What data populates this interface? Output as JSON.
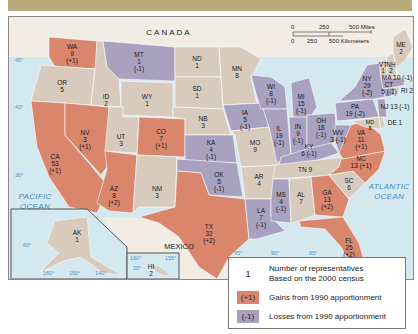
{
  "colors": {
    "gain": "#d9866d",
    "loss": "#a9a1c0",
    "nochange": "#d8cbbd",
    "water": "#d4e8f0",
    "foreign": "#f1ede4",
    "top_band": "#b7ab79"
  },
  "labels": {
    "canada": "CANADA",
    "mexico": "MEXICO",
    "pacific": [
      "PACIFIC",
      "OCEAN"
    ],
    "atlantic": [
      "ATLANTIC",
      "OCEAN"
    ]
  },
  "scale_bar": {
    "miles": [
      "0",
      "250",
      "500 Miles"
    ],
    "km": [
      "0",
      "250",
      "500 Kilometers"
    ]
  },
  "graticule": {
    "lat": [
      "45°",
      "40°",
      "30°"
    ],
    "lon": [
      "95°",
      "90°",
      "85°"
    ],
    "alaska_lon": [
      "160°",
      "150°",
      "140°"
    ],
    "alaska_lat": "60°",
    "hawaii_lon": [
      "160°",
      "155°"
    ],
    "hawaii_lat": "20°"
  },
  "states": [
    {
      "abbr": "WA",
      "reps": "9",
      "change": "(+1)",
      "status": "gain"
    },
    {
      "abbr": "OR",
      "reps": "5",
      "change": "",
      "status": "nochange"
    },
    {
      "abbr": "CA",
      "reps": "53",
      "change": "(+1)",
      "status": "gain"
    },
    {
      "abbr": "ID",
      "reps": "2",
      "change": "",
      "status": "nochange"
    },
    {
      "abbr": "NV",
      "reps": "3",
      "change": "(+1)",
      "status": "gain"
    },
    {
      "abbr": "MT",
      "reps": "1",
      "change": "(-1)",
      "status": "loss"
    },
    {
      "abbr": "WY",
      "reps": "1",
      "change": "",
      "status": "nochange"
    },
    {
      "abbr": "UT",
      "reps": "3",
      "change": "",
      "status": "nochange"
    },
    {
      "abbr": "CO",
      "reps": "7",
      "change": "(+1)",
      "status": "gain"
    },
    {
      "abbr": "AZ",
      "reps": "8",
      "change": "(+2)",
      "status": "gain"
    },
    {
      "abbr": "NM",
      "reps": "3",
      "change": "",
      "status": "nochange"
    },
    {
      "abbr": "ND",
      "reps": "1",
      "change": "",
      "status": "nochange"
    },
    {
      "abbr": "SD",
      "reps": "1",
      "change": "",
      "status": "nochange"
    },
    {
      "abbr": "NB",
      "reps": "3",
      "change": "",
      "status": "nochange"
    },
    {
      "abbr": "KA",
      "reps": "4",
      "change": "(-1)",
      "status": "loss"
    },
    {
      "abbr": "OK",
      "reps": "5",
      "change": "(-1)",
      "status": "loss"
    },
    {
      "abbr": "TX",
      "reps": "32",
      "change": "(+2)",
      "status": "gain"
    },
    {
      "abbr": "MN",
      "reps": "8",
      "change": "",
      "status": "nochange"
    },
    {
      "abbr": "IA",
      "reps": "5",
      "change": "(-1)",
      "status": "loss"
    },
    {
      "abbr": "MO",
      "reps": "9",
      "change": "",
      "status": "nochange"
    },
    {
      "abbr": "AR",
      "reps": "4",
      "change": "",
      "status": "nochange"
    },
    {
      "abbr": "LA",
      "reps": "7",
      "change": "(-1)",
      "status": "loss"
    },
    {
      "abbr": "WI",
      "reps": "8",
      "change": "(-1)",
      "status": "loss"
    },
    {
      "abbr": "IL",
      "reps": "19",
      "change": "(-1)",
      "status": "loss"
    },
    {
      "abbr": "MI",
      "reps": "15",
      "change": "(-1)",
      "status": "loss"
    },
    {
      "abbr": "IN",
      "reps": "9",
      "change": "(-1)",
      "status": "loss"
    },
    {
      "abbr": "OH",
      "reps": "18",
      "change": "(-1)",
      "status": "loss"
    },
    {
      "abbr": "KY",
      "reps": "6",
      "change": "(-1)",
      "status": "loss"
    },
    {
      "abbr": "TN",
      "reps": "9",
      "change": "",
      "status": "nochange"
    },
    {
      "abbr": "MS",
      "reps": "4",
      "change": "(-1)",
      "status": "loss"
    },
    {
      "abbr": "AL",
      "reps": "7",
      "change": "",
      "status": "nochange"
    },
    {
      "abbr": "GA",
      "reps": "13",
      "change": "(+2)",
      "status": "gain"
    },
    {
      "abbr": "FL",
      "reps": "25",
      "change": "(+2)",
      "status": "gain"
    },
    {
      "abbr": "SC",
      "reps": "6",
      "change": "",
      "status": "nochange"
    },
    {
      "abbr": "NC",
      "reps": "13",
      "change": "(+1)",
      "status": "gain"
    },
    {
      "abbr": "VA",
      "reps": "11",
      "change": "(+1)",
      "status": "gain"
    },
    {
      "abbr": "WV",
      "reps": "3",
      "change": "(-1)",
      "status": "loss"
    },
    {
      "abbr": "PA",
      "reps": "19",
      "change": "(-2)",
      "status": "loss"
    },
    {
      "abbr": "NY",
      "reps": "29",
      "change": "(-2)",
      "status": "loss"
    },
    {
      "abbr": "MD",
      "reps": "8",
      "change": "",
      "status": "nochange"
    },
    {
      "abbr": "DE",
      "reps": "1",
      "change": "",
      "status": "nochange"
    },
    {
      "abbr": "NJ",
      "reps": "13",
      "change": "(-1)",
      "status": "loss"
    },
    {
      "abbr": "CT",
      "reps": "5",
      "change": "(-1)",
      "status": "loss"
    },
    {
      "abbr": "RI",
      "reps": "2",
      "change": "",
      "status": "nochange"
    },
    {
      "abbr": "MA",
      "reps": "10",
      "change": "(-1)",
      "status": "loss"
    },
    {
      "abbr": "VT",
      "reps": "1",
      "change": "",
      "status": "nochange"
    },
    {
      "abbr": "NH",
      "reps": "2",
      "change": "",
      "status": "nochange"
    },
    {
      "abbr": "ME",
      "reps": "2",
      "change": "",
      "status": "nochange"
    },
    {
      "abbr": "AK",
      "reps": "1",
      "change": "",
      "status": "nochange"
    },
    {
      "abbr": "HI",
      "reps": "2",
      "change": "",
      "status": "nochange"
    }
  ],
  "text": {
    "WA": [
      "WA",
      "9",
      "(+1)"
    ],
    "OR": [
      "OR",
      "5"
    ],
    "CA": [
      "CA",
      "53",
      "(+1)"
    ],
    "ID": [
      "ID",
      "2"
    ],
    "NV": [
      "NV",
      "3",
      "(+1)"
    ],
    "MT": [
      "MT",
      "1",
      "(-1)"
    ],
    "WY": [
      "WY",
      "1"
    ],
    "UT": [
      "UT",
      "3"
    ],
    "CO": [
      "CO",
      "7",
      "(+1)"
    ],
    "AZ": [
      "AZ",
      "8",
      "(+2)"
    ],
    "NM": [
      "NM",
      "3"
    ],
    "ND": [
      "ND",
      "1"
    ],
    "SD": [
      "SD",
      "1"
    ],
    "NB": [
      "NB",
      "3"
    ],
    "KA": [
      "KA",
      "4",
      "(-1)"
    ],
    "OK": [
      "OK",
      "5",
      "(-1)"
    ],
    "TX": [
      "TX",
      "32",
      "(+2)"
    ],
    "MN": [
      "MN",
      "8"
    ],
    "IA": [
      "IA",
      "5",
      "(-1)"
    ],
    "MO": [
      "MO",
      "9"
    ],
    "AR": [
      "AR",
      "4"
    ],
    "LA": [
      "LA",
      "7",
      "(-1)"
    ],
    "WI": [
      "WI",
      "8",
      "(-1)"
    ],
    "IL": [
      "IL",
      "19",
      "(-1)"
    ],
    "MI": [
      "MI",
      "15",
      "(-1)"
    ],
    "IN": [
      "IN",
      "9",
      "(-1)"
    ],
    "OH": [
      "OH",
      "18",
      "(-1)"
    ],
    "KY": [
      "KY",
      "6 (-1)"
    ],
    "TN": [
      "TN 9"
    ],
    "MS": [
      "MS",
      "4",
      "(-1)"
    ],
    "AL": [
      "AL",
      "7"
    ],
    "GA": [
      "GA",
      "13",
      "(+2)"
    ],
    "FL": [
      "FL",
      "25",
      "(+2)"
    ],
    "SC": [
      "SC",
      "6"
    ],
    "NC": [
      "NC",
      "13 (+1)"
    ],
    "VA": [
      "VA",
      "11",
      "(+1)"
    ],
    "WV": [
      "WV",
      "3 (-1)"
    ],
    "PA": [
      "PA",
      "19 (-2)"
    ],
    "NY": [
      "NY",
      "29",
      "(-2)"
    ],
    "MD": [
      "MD",
      "8"
    ],
    "DE": [
      "DE 1"
    ],
    "NJ": [
      "NJ 13 (-1)"
    ],
    "CT": [
      "CT",
      "5 (-1)"
    ],
    "RI": [
      "RI 2"
    ],
    "MA": [
      "MA 10 (-1)"
    ],
    "VT": [
      "VT",
      "1"
    ],
    "NH": [
      "NH",
      "2"
    ],
    "ME": [
      "ME",
      "2"
    ],
    "AK": [
      "AK",
      "1"
    ],
    "HI": [
      "HI",
      "2"
    ]
  },
  "legend": {
    "number_key": "1",
    "number_desc_1": "Number of representatives",
    "number_desc_2": "Based on the 2000 census",
    "gain_swatch": "(+1)",
    "gain_desc": "Gains from 1990 apportionment",
    "loss_swatch": "(-1)",
    "loss_desc": "Losses from 1990 apportionment"
  }
}
